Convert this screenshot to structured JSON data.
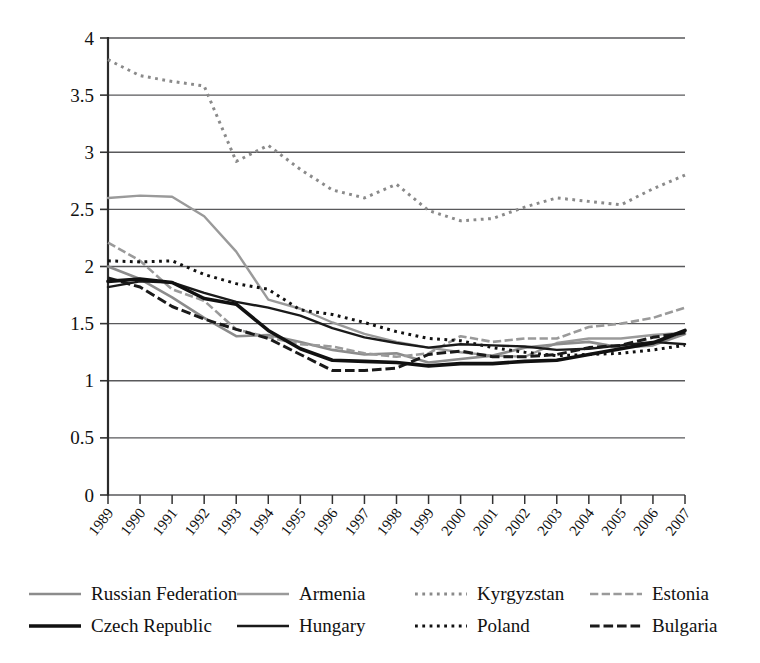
{
  "chart_data": {
    "type": "line",
    "title": "",
    "xlabel": "",
    "ylabel": "",
    "ylim": [
      0,
      4
    ],
    "ytick_step": 0.5,
    "yticks": [
      "0",
      "0.5",
      "1",
      "1.5",
      "2",
      "2.5",
      "3",
      "3.5",
      "4"
    ],
    "grid": true,
    "grid_axis": "y",
    "legend_position": "below",
    "categories": [
      "1989",
      "1990",
      "1991",
      "1992",
      "1993",
      "1994",
      "1995",
      "1996",
      "1997",
      "1998",
      "1999",
      "2000",
      "2001",
      "2002",
      "2003",
      "2004",
      "2005",
      "2006",
      "2007"
    ],
    "series": [
      {
        "name": "Russian Federation",
        "color": "#8c8c8c",
        "style": "solid",
        "width": 2.6,
        "values": [
          2.0,
          1.89,
          1.73,
          1.55,
          1.39,
          1.4,
          1.34,
          1.27,
          1.23,
          1.24,
          1.16,
          1.19,
          1.22,
          1.29,
          1.32,
          1.34,
          1.29,
          1.31,
          1.41
        ]
      },
      {
        "name": "Armenia",
        "color": "#9a9a9a",
        "style": "solid",
        "width": 2.4,
        "values": [
          2.6,
          2.62,
          2.61,
          2.44,
          2.13,
          1.71,
          1.63,
          1.51,
          1.41,
          1.34,
          1.29,
          1.25,
          1.22,
          1.21,
          1.33,
          1.37,
          1.37,
          1.4,
          1.42
        ]
      },
      {
        "name": "Kyrgyzstan",
        "color": "#8a8a8a",
        "style": "dotted",
        "width": 3.0,
        "values": [
          3.81,
          3.67,
          3.62,
          3.58,
          2.92,
          3.06,
          2.85,
          2.67,
          2.6,
          2.72,
          2.49,
          2.4,
          2.42,
          2.52,
          2.6,
          2.57,
          2.54,
          2.68,
          2.8
        ]
      },
      {
        "name": "Estonia",
        "color": "#9a9a9a",
        "style": "dashdot",
        "width": 2.6,
        "values": [
          2.21,
          2.05,
          1.8,
          1.7,
          1.45,
          1.38,
          1.32,
          1.3,
          1.24,
          1.21,
          1.24,
          1.39,
          1.34,
          1.37,
          1.37,
          1.47,
          1.5,
          1.55,
          1.64
        ]
      },
      {
        "name": "Czech Republic",
        "color": "#111111",
        "style": "solid",
        "width": 3.6,
        "values": [
          1.87,
          1.89,
          1.86,
          1.72,
          1.67,
          1.44,
          1.28,
          1.18,
          1.17,
          1.16,
          1.13,
          1.15,
          1.15,
          1.17,
          1.18,
          1.23,
          1.28,
          1.33,
          1.44
        ]
      },
      {
        "name": "Hungary",
        "color": "#1a1a1a",
        "style": "solid",
        "width": 2.4,
        "values": [
          1.82,
          1.87,
          1.86,
          1.77,
          1.69,
          1.64,
          1.57,
          1.46,
          1.38,
          1.33,
          1.29,
          1.32,
          1.31,
          1.3,
          1.27,
          1.28,
          1.31,
          1.34,
          1.32
        ]
      },
      {
        "name": "Poland",
        "color": "#111111",
        "style": "dotted",
        "width": 3.0,
        "values": [
          2.05,
          2.04,
          2.05,
          1.93,
          1.85,
          1.8,
          1.62,
          1.58,
          1.51,
          1.43,
          1.37,
          1.35,
          1.29,
          1.25,
          1.22,
          1.23,
          1.24,
          1.27,
          1.31
        ]
      },
      {
        "name": "Bulgaria",
        "color": "#1a1a1a",
        "style": "dashdot",
        "width": 3.0,
        "values": [
          1.9,
          1.82,
          1.65,
          1.54,
          1.45,
          1.37,
          1.23,
          1.09,
          1.09,
          1.11,
          1.23,
          1.26,
          1.21,
          1.21,
          1.23,
          1.29,
          1.31,
          1.38,
          1.42
        ]
      }
    ]
  },
  "legend": {
    "rows": [
      [
        {
          "label": "Russian Federation"
        },
        {
          "label": "Armenia"
        },
        {
          "label": "Kyrgyzstan"
        },
        {
          "label": "Estonia"
        }
      ],
      [
        {
          "label": "Czech Republic"
        },
        {
          "label": "Hungary"
        },
        {
          "label": "Poland"
        },
        {
          "label": "Bulgaria"
        }
      ]
    ]
  }
}
